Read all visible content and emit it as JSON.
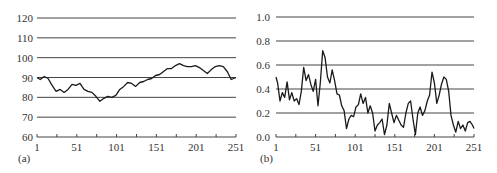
{
  "chart_data": [
    {
      "type": "line",
      "panel_label": "(a)",
      "title": "",
      "xlabel": "",
      "ylabel": "",
      "xlim": [
        1,
        251
      ],
      "ylim": [
        60,
        120
      ],
      "xticks": [
        1,
        51,
        101,
        151,
        201,
        251
      ],
      "xtick_labels": [
        "1",
        "51",
        "101",
        "151",
        "201",
        "251"
      ],
      "yticks": [
        60,
        70,
        80,
        90,
        100,
        110,
        120
      ],
      "ytick_labels": [
        "60",
        "70",
        "80",
        "90",
        "100",
        "110",
        "120"
      ],
      "grid": "horizontal",
      "legend": "none",
      "series": [
        {
          "name": "series-a",
          "x": [
            1,
            5,
            10,
            15,
            20,
            25,
            30,
            35,
            40,
            45,
            50,
            55,
            60,
            65,
            70,
            75,
            80,
            85,
            90,
            95,
            100,
            105,
            110,
            115,
            120,
            125,
            130,
            135,
            140,
            145,
            150,
            155,
            160,
            165,
            170,
            175,
            180,
            185,
            190,
            195,
            200,
            205,
            210,
            215,
            220,
            225,
            230,
            235,
            240,
            245,
            251
          ],
          "values": [
            90,
            89,
            90.5,
            89.5,
            86,
            83,
            84,
            82.5,
            84,
            86.5,
            86,
            87,
            84,
            83,
            82.5,
            80.5,
            78,
            79.5,
            80.5,
            80,
            81,
            84,
            85.5,
            87.5,
            87,
            85.5,
            87.5,
            88,
            89,
            89.5,
            91,
            91.5,
            93,
            94.5,
            94.5,
            96,
            97,
            96,
            95.5,
            95.5,
            96,
            95,
            93.5,
            92,
            94,
            95.5,
            96,
            95.5,
            93,
            89,
            90
          ]
        }
      ]
    },
    {
      "type": "line",
      "panel_label": "(b)",
      "title": "",
      "xlabel": "",
      "ylabel": "",
      "xlim": [
        1,
        251
      ],
      "ylim": [
        0.0,
        1.0
      ],
      "xticks": [
        1,
        51,
        101,
        151,
        201,
        251
      ],
      "xtick_labels": [
        "1",
        "51",
        "101",
        "151",
        "201",
        "251"
      ],
      "yticks": [
        0.0,
        0.2,
        0.4,
        0.6,
        0.8,
        1.0
      ],
      "ytick_labels": [
        "0.0",
        "0.2",
        "0.4",
        "0.6",
        "0.8",
        "1.0"
      ],
      "grid": "horizontal",
      "legend": "none",
      "series": [
        {
          "name": "series-b",
          "x": [
            1,
            3,
            6,
            9,
            12,
            15,
            18,
            21,
            24,
            27,
            30,
            33,
            36,
            39,
            42,
            45,
            48,
            51,
            54,
            57,
            60,
            63,
            66,
            69,
            72,
            75,
            78,
            81,
            84,
            87,
            90,
            93,
            96,
            99,
            102,
            105,
            108,
            111,
            114,
            117,
            120,
            123,
            126,
            129,
            132,
            135,
            138,
            141,
            144,
            147,
            150,
            153,
            156,
            159,
            162,
            165,
            168,
            171,
            174,
            177,
            180,
            183,
            186,
            189,
            192,
            195,
            198,
            201,
            204,
            207,
            210,
            213,
            216,
            219,
            222,
            225,
            228,
            231,
            234,
            237,
            240,
            243,
            246,
            249,
            251
          ],
          "values": [
            0.5,
            0.45,
            0.3,
            0.37,
            0.33,
            0.46,
            0.31,
            0.37,
            0.3,
            0.32,
            0.27,
            0.38,
            0.58,
            0.47,
            0.52,
            0.44,
            0.38,
            0.48,
            0.26,
            0.46,
            0.72,
            0.66,
            0.5,
            0.45,
            0.56,
            0.47,
            0.36,
            0.35,
            0.26,
            0.22,
            0.07,
            0.15,
            0.18,
            0.17,
            0.25,
            0.27,
            0.36,
            0.28,
            0.33,
            0.2,
            0.26,
            0.2,
            0.05,
            0.1,
            0.12,
            0.15,
            0.02,
            0.1,
            0.28,
            0.2,
            0.12,
            0.18,
            0.14,
            0.1,
            0.08,
            0.2,
            0.28,
            0.3,
            0.15,
            0.02,
            0.2,
            0.25,
            0.18,
            0.22,
            0.3,
            0.35,
            0.54,
            0.45,
            0.28,
            0.35,
            0.44,
            0.5,
            0.48,
            0.38,
            0.18,
            0.1,
            0.04,
            0.13,
            0.07,
            0.1,
            0.05,
            0.12,
            0.13,
            0.1,
            0.07
          ],
          "note": "values approximate"
        }
      ]
    }
  ]
}
